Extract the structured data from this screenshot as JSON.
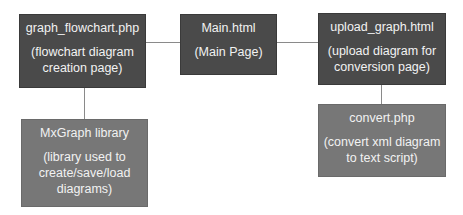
{
  "nodes": {
    "flowchart": {
      "title": "graph_flowchart.php",
      "desc": "(flowchart diagram\ncreation page)"
    },
    "main": {
      "title": "Main.html",
      "desc": "(Main Page)"
    },
    "upload": {
      "title": "upload_graph.html",
      "desc": "(upload diagram for\nconversion page)"
    },
    "mxgraph": {
      "title": "MxGraph library",
      "desc": "(library used to\ncreate/save/load\ndiagrams)"
    },
    "convert": {
      "title": "convert.php",
      "desc": "(convert xml diagram\nto text script)"
    }
  },
  "edges": [
    {
      "from": "flowchart",
      "to": "main"
    },
    {
      "from": "main",
      "to": "upload"
    },
    {
      "from": "flowchart",
      "to": "mxgraph"
    },
    {
      "from": "upload",
      "to": "convert"
    }
  ],
  "colors": {
    "primary_box": "#4a4a4a",
    "secondary_box": "#777777",
    "text": "#f2f2f2",
    "connector": "#8a8a8a"
  }
}
